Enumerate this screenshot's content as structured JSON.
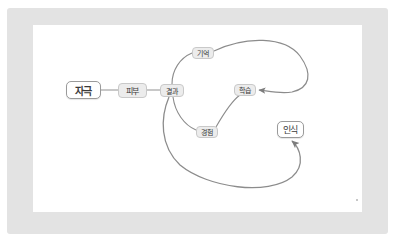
{
  "diagram": {
    "language": "ko",
    "canvas": {
      "background_color": "#ffffff",
      "frame_color": "#e3e3e3"
    },
    "colors": {
      "edge": "#8c8c8c",
      "node_primary_fill": "#ffffff",
      "node_primary_border": "#9a9a9a",
      "node_secondary_fill": "#ececec",
      "node_secondary_border": "#c9c9c9",
      "text": "#3a3a3a"
    },
    "nodes": [
      {
        "id": "jagueuk",
        "label": "자극",
        "style": "primary",
        "x": 83,
        "y": 90
      },
      {
        "id": "pibu",
        "label": "피부",
        "style": "secondary",
        "x": 132,
        "y": 90
      },
      {
        "id": "gyeolgwa",
        "label": "결과",
        "style": "secondary",
        "x": 172,
        "y": 90
      },
      {
        "id": "gieok",
        "label": "기억",
        "style": "secondary",
        "x": 203,
        "y": 53
      },
      {
        "id": "haksup",
        "label": "학습",
        "style": "secondary",
        "x": 245,
        "y": 90
      },
      {
        "id": "gyeongheom",
        "label": "경험",
        "style": "secondary",
        "x": 207,
        "y": 132
      },
      {
        "id": "insik",
        "label": "인식",
        "style": "primary",
        "x": 290,
        "y": 129
      }
    ],
    "edges": [
      {
        "id": "e1",
        "from": "jagueuk",
        "to": "pibu",
        "type": "line",
        "arrow": false
      },
      {
        "id": "e2",
        "from": "pibu",
        "to": "gyeolgwa",
        "type": "line",
        "arrow": false
      },
      {
        "id": "e3",
        "from": "gyeolgwa",
        "to": "gieok",
        "type": "curve",
        "arrow": false
      },
      {
        "id": "e4",
        "from": "gieok",
        "to": "haksup",
        "type": "curve",
        "arrow": true
      },
      {
        "id": "e5",
        "from": "gyeolgwa",
        "to": "gyeongheom",
        "type": "curve",
        "arrow": false
      },
      {
        "id": "e6",
        "from": "gyeongheom",
        "to": "haksup",
        "type": "curve",
        "arrow": false
      },
      {
        "id": "e7",
        "from": "gyeolgwa",
        "to": "insik",
        "type": "curve",
        "arrow": true
      }
    ]
  }
}
